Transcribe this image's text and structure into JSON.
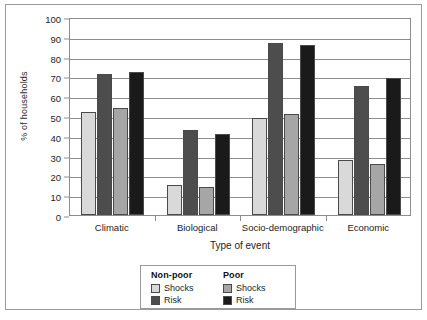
{
  "chart_data": {
    "type": "bar",
    "title": "",
    "subtitle": "",
    "xlabel": "Type of event",
    "ylabel": "% of households",
    "categories": [
      "Climatic",
      "Biological",
      "Socio-demographic",
      "Economic"
    ],
    "series": [
      {
        "name": "Shocks",
        "group": "Non-poor",
        "color": "#d9d9d9",
        "values": [
          52,
          15,
          49,
          28
        ]
      },
      {
        "name": "Risk",
        "group": "Non-poor",
        "color": "#4d4d4d",
        "values": [
          71,
          43,
          87,
          65
        ]
      },
      {
        "name": "Shocks",
        "group": "Poor",
        "color": "#a6a6a6",
        "values": [
          54,
          14,
          51,
          26
        ]
      },
      {
        "name": "Risk",
        "group": "Poor",
        "color": "#1a1a1a",
        "values": [
          72,
          41,
          86,
          69
        ]
      }
    ],
    "ylim": [
      0,
      100
    ],
    "ytick_step": 10,
    "yticks": [
      100,
      90,
      80,
      70,
      60,
      50,
      40,
      30,
      20,
      10,
      0
    ],
    "grid": true,
    "legend_position": "bottom-center"
  },
  "legend": {
    "columns": [
      {
        "heading": "Non-poor",
        "entries": [
          {
            "label": "Shocks",
            "color": "#d9d9d9"
          },
          {
            "label": "Risk",
            "color": "#4d4d4d"
          }
        ]
      },
      {
        "heading": "Poor",
        "entries": [
          {
            "label": "Shocks",
            "color": "#a6a6a6"
          },
          {
            "label": "Risk",
            "color": "#1a1a1a"
          }
        ]
      }
    ]
  }
}
